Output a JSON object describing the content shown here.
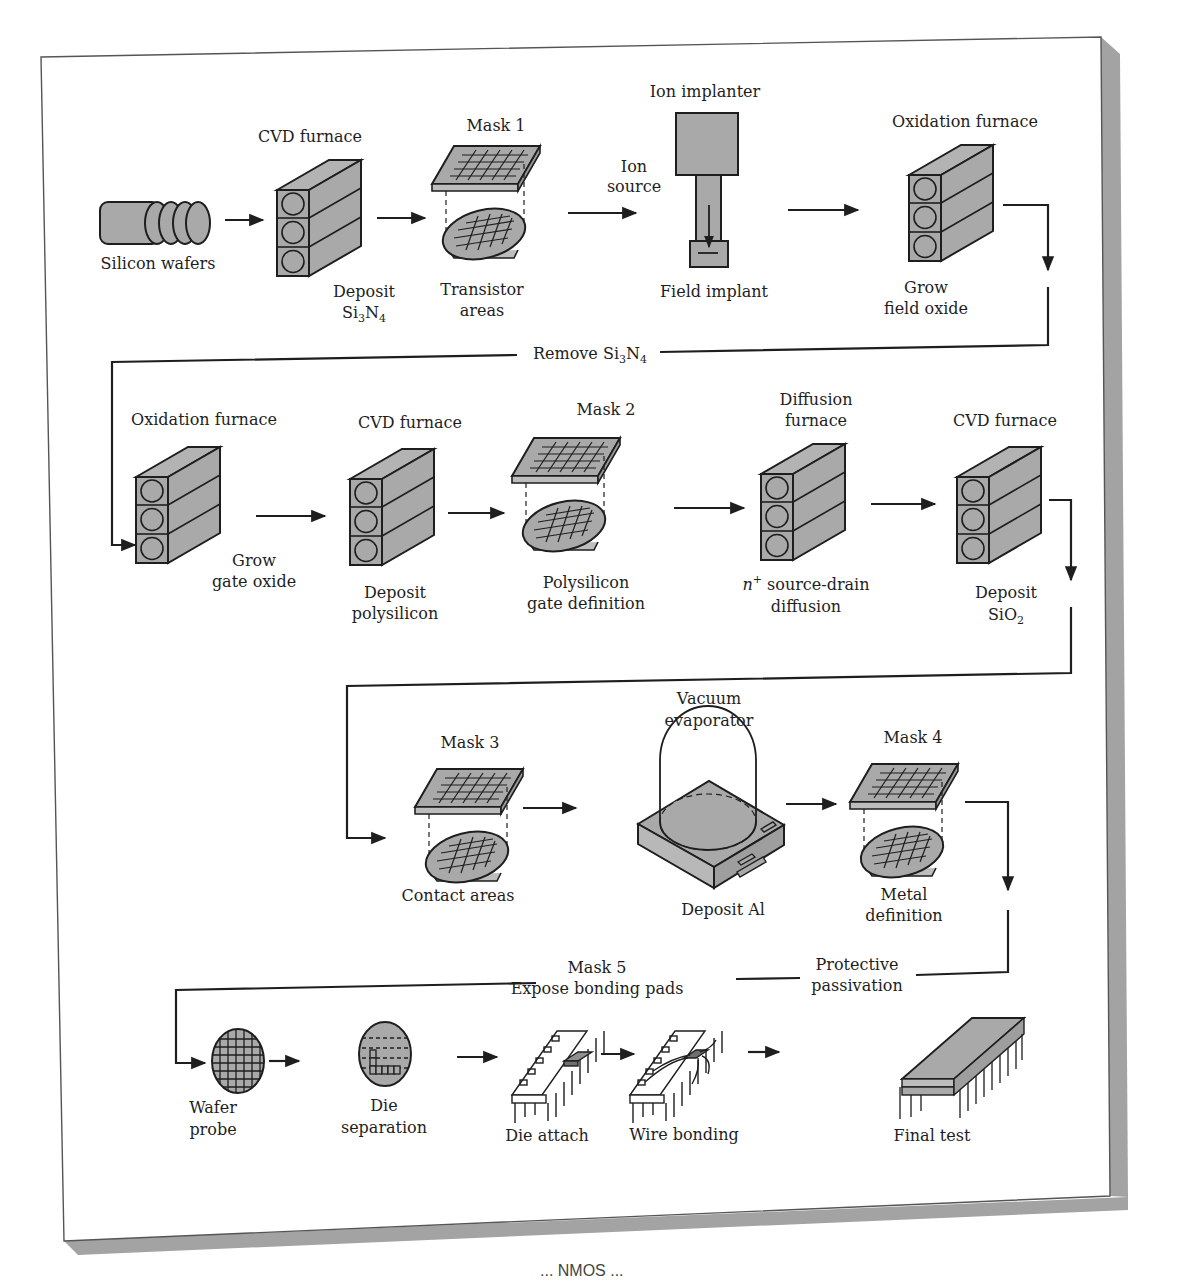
{
  "colors": {
    "fill": "#a9a9a9",
    "stroke": "#1e1e1e",
    "shadow": "#9e9e9e",
    "paper": "#ffffff"
  },
  "row1": {
    "silicon_wafers": "Silicon wafers",
    "cvd_title": "CVD furnace",
    "cvd_step_line1": "Deposit",
    "cvd_step_line2": "Si3N4",
    "mask1_title": "Mask 1",
    "mask1_step_line1": "Transistor",
    "mask1_step_line2": "areas",
    "ion_source_line1": "Ion",
    "ion_source_line2": "source",
    "implanter_title": "Ion implanter",
    "implanter_step": "Field implant",
    "oxidation_title": "Oxidation furnace",
    "oxidation_step_line1": "Grow",
    "oxidation_step_line2": "field oxide"
  },
  "connector1": "Remove Si3N4",
  "row2": {
    "oxidation_title": "Oxidation furnace",
    "oxidation_step_line1": "Grow",
    "oxidation_step_line2": "gate oxide",
    "cvd_title": "CVD furnace",
    "cvd_step_line1": "Deposit",
    "cvd_step_line2": "polysilicon",
    "mask2_title": "Mask 2",
    "mask2_step_line1": "Polysilicon",
    "mask2_step_line2": "gate definition",
    "diffusion_title_line1": "Diffusion",
    "diffusion_title_line2": "furnace",
    "diffusion_step_line1": "n+ source-drain",
    "diffusion_step_line2": "diffusion",
    "cvd2_title": "CVD furnace",
    "cvd2_step_line1": "Deposit",
    "cvd2_step_line2": "SiO2"
  },
  "row3": {
    "mask3_title": "Mask 3",
    "mask3_step": "Contact areas",
    "vacuum_title_line1": "Vacuum",
    "vacuum_title_line2": "evaporator",
    "vacuum_step": "Deposit Al",
    "mask4_title": "Mask 4",
    "mask4_step_line1": "Metal",
    "mask4_step_line2": "definition"
  },
  "connector3": {
    "mask5_line1": "Mask 5",
    "mask5_line2": "Expose bonding pads",
    "passivation_line1": "Protective",
    "passivation_line2": "passivation"
  },
  "row4": {
    "probe_line1": "Wafer",
    "probe_line2": "probe",
    "separation_line1": "Die",
    "separation_line2": "separation",
    "attach": "Die attach",
    "bonding": "Wire bonding",
    "final": "Final test"
  },
  "caption_fragment": "... NMOS ... "
}
